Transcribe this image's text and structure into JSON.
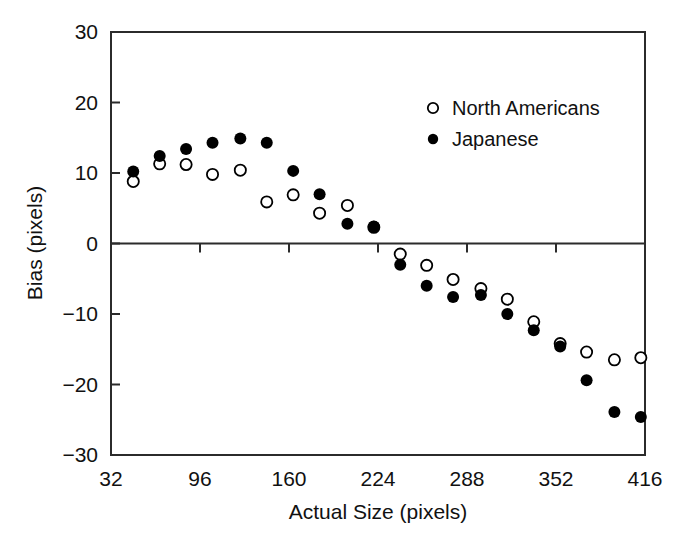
{
  "chart_data": {
    "type": "scatter",
    "title": "",
    "xlabel": "Actual Size (pixels)",
    "ylabel": "Bias (pixels)",
    "xlim": [
      32,
      416
    ],
    "ylim": [
      -30,
      30
    ],
    "xticks": [
      32,
      96,
      160,
      224,
      288,
      352,
      416
    ],
    "xtick_labels": [
      "32",
      "96",
      "160",
      "224",
      "288",
      "352",
      "416"
    ],
    "yticks": [
      30,
      20,
      10,
      0,
      -10,
      -20,
      -30
    ],
    "ytick_labels": [
      "30",
      "20",
      "10",
      "0",
      "−10",
      "−20",
      "−30"
    ],
    "grid": false,
    "zero_line": true,
    "legend_position": "top-right",
    "x": [
      48,
      67,
      86,
      105,
      125,
      144,
      163,
      182,
      202,
      221,
      240,
      259,
      278,
      298,
      317,
      336,
      355,
      374,
      394,
      413
    ],
    "series": [
      {
        "name": "North Americans",
        "marker": "open-circle",
        "color": "#000000",
        "values": [
          8.8,
          11.3,
          11.2,
          9.8,
          10.4,
          5.9,
          6.9,
          4.3,
          5.4,
          2.3,
          -1.5,
          -3.1,
          -5.1,
          -6.4,
          -7.9,
          -11.1,
          -14.2,
          -15.4,
          -16.5,
          -16.2
        ]
      },
      {
        "name": "Japanese",
        "marker": "filled-circle",
        "color": "#000000",
        "values": [
          10.2,
          12.4,
          13.4,
          14.3,
          14.9,
          14.3,
          10.3,
          7.0,
          2.8,
          2.4,
          -3.0,
          -6.0,
          -7.6,
          -7.3,
          -10.0,
          -12.3,
          -14.6,
          -19.4,
          -23.9,
          -24.6
        ]
      }
    ]
  },
  "legend": {
    "entries": [
      {
        "label": "North Americans",
        "marker": "open-circle"
      },
      {
        "label": "Japanese",
        "marker": "filled-circle"
      }
    ]
  },
  "axes": {
    "x_title": "Actual Size (pixels)",
    "y_title": "Bias (pixels)"
  }
}
